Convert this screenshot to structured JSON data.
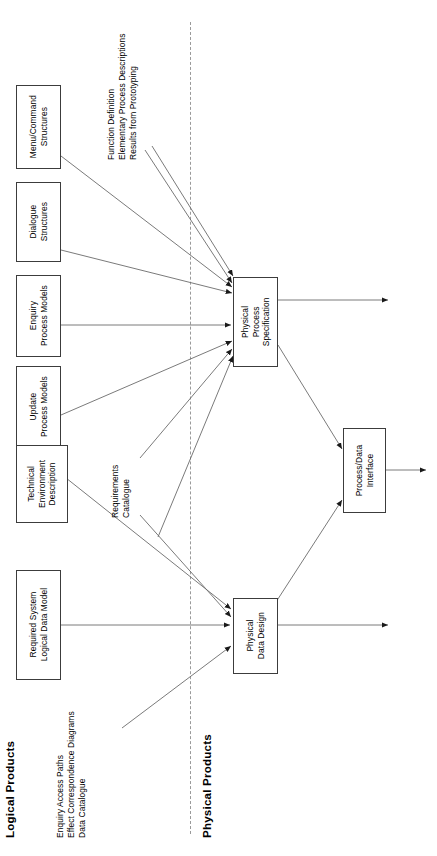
{
  "diagram": {
    "title_left": "Logical Products",
    "title_right": "Physical Products",
    "orientation": "rotated-90-ccw",
    "divider": "dashed-vertical",
    "nodes": [
      {
        "id": "menu_command",
        "label": "Menu/Command\nStructures",
        "line1": "Menu/Command",
        "line2": "Structures",
        "side": "logical"
      },
      {
        "id": "dialogue",
        "label": "Dialogue\nStructures",
        "line1": "Dialogue",
        "line2": "Structures",
        "side": "logical"
      },
      {
        "id": "enquiry_process",
        "label": "Enquiry\nProcess Models",
        "line1": "Enquiry",
        "line2": "Process Models",
        "side": "logical"
      },
      {
        "id": "update_process",
        "label": "Update\nProcess Models",
        "line1": "Update",
        "line2": "Process Models",
        "side": "logical"
      },
      {
        "id": "technical_env",
        "label": "Technical\nEnvironment\nDescription",
        "line1": "Technical",
        "line2": "Environment",
        "line3": "Description",
        "side": "logical"
      },
      {
        "id": "required_system",
        "label": "Required System\nLogical Data Model",
        "line1": "Required System",
        "line2": "Logical Data Model",
        "side": "logical"
      },
      {
        "id": "physical_process_spec",
        "label": "Physical\nProcess\nSpecification",
        "line1": "Physical",
        "line2": "Process",
        "line3": "Specification",
        "side": "physical"
      },
      {
        "id": "process_data_interface",
        "label": "Process/Data\nInterface",
        "line1": "Process/Data",
        "line2": "Interface",
        "side": "physical"
      },
      {
        "id": "physical_data_design",
        "label": "Physical\nData Design",
        "line1": "Physical",
        "line2": "Data Design",
        "side": "physical"
      }
    ],
    "annotations": [
      {
        "id": "top_annotation",
        "lines": [
          "Function Definition",
          "Elementary Process Descriptions",
          "Results from Prototyping"
        ],
        "line1": "Function Definition",
        "line2": "Elementary Process Descriptions",
        "line3": "Results from Prototyping"
      },
      {
        "id": "requirements_annotation",
        "lines": [
          "Requirements",
          "Catalogue"
        ],
        "line1": "Requirements",
        "line2": "Catalogue"
      },
      {
        "id": "bottom_annotation",
        "lines": [
          "Enquiry Access Paths",
          "Effect Correspondence Diagrams",
          "Data Catalogue"
        ],
        "line1": "Enquiry Access Paths",
        "line2": "Effect Correspondence Diagrams",
        "line3": "Data Catalogue"
      }
    ],
    "colors": {
      "box_border": "#3c3c3c",
      "edge": "#6b6b6b",
      "divider": "#9a9a9a",
      "text": "#000000",
      "background": "#ffffff"
    }
  }
}
